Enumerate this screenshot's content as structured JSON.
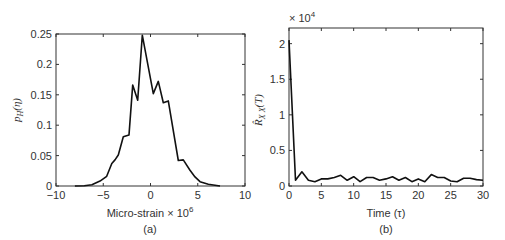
{
  "chart_data": [
    {
      "type": "line",
      "panel": "(a)",
      "title": "",
      "xlabel": "Micro-strain × 10^6",
      "xlabel_main": "Micro-strain × 10",
      "xlabel_exp": "6",
      "ylabel": "p_H(η)",
      "xlim": [
        -10,
        10
      ],
      "ylim": [
        0,
        0.25
      ],
      "xticks": [
        -10,
        -5,
        0,
        5,
        10
      ],
      "yticks": [
        0,
        0.05,
        0.1,
        0.15,
        0.2,
        0.25
      ],
      "xtick_labels": [
        "−10",
        "−5",
        "0",
        "5",
        "10"
      ],
      "ytick_labels": [
        "0",
        "0.05",
        "0.1",
        "0.15",
        "0.2",
        "0.25"
      ],
      "grid": false,
      "x": [
        -8.0,
        -7.0,
        -6.2,
        -5.34,
        -4.63,
        -4.1,
        -3.76,
        -3.41,
        -2.88,
        -2.27,
        -1.88,
        -1.35,
        -0.87,
        0.3,
        0.83,
        1.35,
        1.88,
        2.94,
        3.47,
        4.18,
        4.71,
        5.24,
        6.12,
        7.35
      ],
      "y": [
        0.0,
        0.0005,
        0.002,
        0.008,
        0.016,
        0.037,
        0.043,
        0.051,
        0.081,
        0.084,
        0.166,
        0.141,
        0.248,
        0.152,
        0.172,
        0.137,
        0.14,
        0.042,
        0.043,
        0.026,
        0.015,
        0.007,
        0.003,
        0.0
      ]
    },
    {
      "type": "line",
      "panel": "(b)",
      "title": "",
      "xlabel": "Time (τ)",
      "ylabel": "R̂_XX(T)",
      "y_multiplier": "× 10^4",
      "xlim": [
        0,
        30
      ],
      "ylim": [
        0,
        2.22
      ],
      "xticks": [
        0,
        5,
        10,
        15,
        20,
        25,
        30
      ],
      "yticks": [
        0,
        0.5,
        1,
        1.5,
        2
      ],
      "xtick_labels": [
        "0",
        "5",
        "10",
        "15",
        "20",
        "25",
        "30"
      ],
      "ytick_labels": [
        "0",
        "0.5",
        "1",
        "1.5",
        "2"
      ],
      "grid": false,
      "x": [
        0,
        1,
        2,
        3,
        4,
        5,
        6,
        7,
        8,
        9,
        10,
        11,
        12,
        13,
        14,
        15,
        16,
        17,
        18,
        19,
        20,
        21,
        22,
        23,
        24,
        25,
        26,
        27,
        28,
        29,
        30
      ],
      "y": [
        2.05,
        0.08,
        0.2,
        0.08,
        0.06,
        0.1,
        0.1,
        0.12,
        0.15,
        0.08,
        0.13,
        0.06,
        0.12,
        0.12,
        0.08,
        0.1,
        0.13,
        0.08,
        0.12,
        0.06,
        0.1,
        0.06,
        0.16,
        0.12,
        0.12,
        0.07,
        0.06,
        0.11,
        0.11,
        0.09,
        0.08
      ]
    }
  ],
  "labels": {
    "a_xlabel": "Micro-strain × 10",
    "a_xlabel_exp": "6",
    "a_panel": "(a)",
    "a_ylabel_main": "p",
    "a_ylabel_sub": "H",
    "a_ylabel_arg": "(η)",
    "b_xlabel": "Time (τ)",
    "b_panel": "(b)",
    "b_multiplier": "× 10",
    "b_multiplier_exp": "4",
    "b_ylabel_main": "R̂",
    "b_ylabel_sub": "X X",
    "b_ylabel_arg": "(T)"
  }
}
